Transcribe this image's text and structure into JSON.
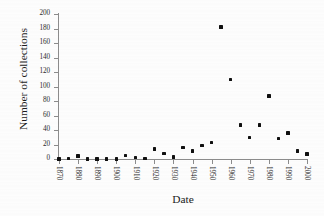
{
  "chart_data": {
    "type": "scatter",
    "title": "",
    "xlabel": "Date",
    "ylabel": "Number of collections",
    "xlim": [
      1870,
      2000
    ],
    "ylim": [
      0,
      200
    ],
    "grid": false,
    "legend": null,
    "marker": "filled-square",
    "marker_color": "#101010",
    "x_tick_labels": [
      "1870",
      "1880",
      "1890",
      "1900",
      "1910",
      "1920",
      "1930",
      "1940",
      "1950",
      "1960",
      "1970",
      "1980",
      "1990",
      "2000"
    ],
    "x_ticks": [
      1870,
      1880,
      1890,
      1900,
      1910,
      1920,
      1930,
      1940,
      1950,
      1960,
      1970,
      1980,
      1990,
      2000
    ],
    "y_tick_labels": [
      "0",
      "20",
      "40",
      "60",
      "80",
      "100",
      "120",
      "140",
      "160",
      "180",
      "200"
    ],
    "y_ticks": [
      0,
      20,
      40,
      60,
      80,
      100,
      120,
      140,
      160,
      180,
      200
    ],
    "x": [
      1870,
      1875,
      1880,
      1885,
      1890,
      1895,
      1900,
      1905,
      1910,
      1915,
      1920,
      1925,
      1930,
      1935,
      1940,
      1945,
      1950,
      1955,
      1960,
      1965,
      1970,
      1975,
      1980,
      1985,
      1990,
      1995,
      2000
    ],
    "values": [
      0,
      1,
      4,
      0,
      0,
      0,
      0,
      5,
      2,
      1,
      14,
      8,
      3,
      16,
      11,
      19,
      23,
      182,
      110,
      47,
      30,
      47,
      87,
      28,
      36,
      11,
      7
    ],
    "points": [
      {
        "x": 1870,
        "y": 0
      },
      {
        "x": 1875,
        "y": 1
      },
      {
        "x": 1880,
        "y": 4
      },
      {
        "x": 1885,
        "y": 0
      },
      {
        "x": 1890,
        "y": 0
      },
      {
        "x": 1895,
        "y": 0
      },
      {
        "x": 1900,
        "y": 0
      },
      {
        "x": 1905,
        "y": 5
      },
      {
        "x": 1910,
        "y": 2
      },
      {
        "x": 1915,
        "y": 1
      },
      {
        "x": 1920,
        "y": 14
      },
      {
        "x": 1925,
        "y": 8
      },
      {
        "x": 1930,
        "y": 3
      },
      {
        "x": 1935,
        "y": 16
      },
      {
        "x": 1940,
        "y": 11
      },
      {
        "x": 1945,
        "y": 19
      },
      {
        "x": 1950,
        "y": 23
      },
      {
        "x": 1955,
        "y": 182
      },
      {
        "x": 1960,
        "y": 110
      },
      {
        "x": 1965,
        "y": 47
      },
      {
        "x": 1970,
        "y": 30
      },
      {
        "x": 1975,
        "y": 47
      },
      {
        "x": 1980,
        "y": 87
      },
      {
        "x": 1985,
        "y": 28
      },
      {
        "x": 1990,
        "y": 36
      },
      {
        "x": 1995,
        "y": 11
      },
      {
        "x": 2000,
        "y": 7
      }
    ]
  },
  "axis_color": "#8c8c8c",
  "text_color": "#1c1c1c",
  "background": "#fdfdfd"
}
